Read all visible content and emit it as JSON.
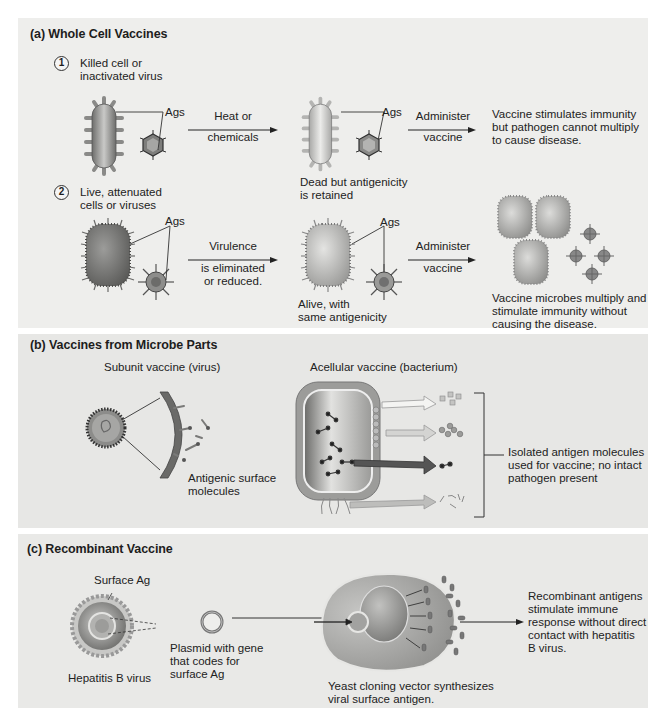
{
  "panels": {
    "a": {
      "title": "(a) Whole Cell Vaccines",
      "step1": {
        "number": "1",
        "label_line1": "Killed cell or",
        "label_line2": "inactivated virus",
        "ags_left": "Ags",
        "arrow1_top": "Heat or",
        "arrow1_bottom": "chemicals",
        "ags_right": "Ags",
        "result_line1": "Dead but antigenicity",
        "result_line2": "is retained",
        "arrow2_top": "Administer",
        "arrow2_bottom": "vaccine",
        "outcome_line1": "Vaccine stimulates immunity",
        "outcome_line2": "but pathogen cannot multiply",
        "outcome_line3": "to cause disease."
      },
      "step2": {
        "number": "2",
        "label_line1": "Live, attenuated",
        "label_line2": "cells or viruses",
        "ags_left": "Ags",
        "arrow1_top": "Virulence",
        "arrow1_bottom1": "is eliminated",
        "arrow1_bottom2": "or reduced.",
        "ags_right": "Ags",
        "result_line1": "Alive, with",
        "result_line2": "same antigenicity",
        "arrow2_top": "Administer",
        "arrow2_bottom": "vaccine",
        "outcome_line1": "Vaccine microbes multiply and",
        "outcome_line2": "stimulate immunity without",
        "outcome_line3": "causing the disease."
      }
    },
    "b": {
      "title": "(b) Vaccines from Microbe Parts",
      "subunit_label": "Subunit vaccine (virus)",
      "surface_line1": "Antigenic surface",
      "surface_line2": "molecules",
      "acellular_label": "Acellular vaccine (bacterium)",
      "isolated_line1": "Isolated antigen molecules",
      "isolated_line2": "used for vaccine; no intact",
      "isolated_line3": "pathogen present"
    },
    "c": {
      "title": "(c) Recombinant Vaccine",
      "surface_ag": "Surface Ag",
      "hepatitis_label": "Hepatitis B virus",
      "plasmid_line1": "Plasmid with gene",
      "plasmid_line2": "that codes for",
      "plasmid_line3": "surface Ag",
      "yeast_line1": "Yeast cloning vector synthesizes",
      "yeast_line2": "viral surface antigen.",
      "outcome_line1": "Recombinant antigens",
      "outcome_line2": "stimulate immune",
      "outcome_line3": "response without direct",
      "outcome_line4": "contact with hepatitis",
      "outcome_line5": "B virus."
    }
  },
  "colors": {
    "panel_bg": "#eeeeec",
    "cell_gray": "#9a9a98",
    "arrow_dark": "#555555",
    "text": "#1d1d1d"
  }
}
